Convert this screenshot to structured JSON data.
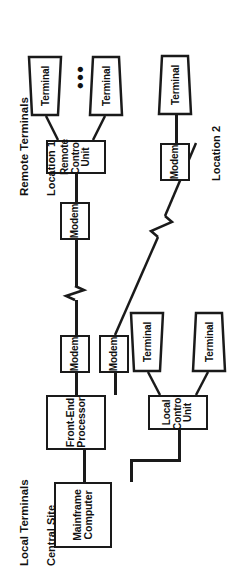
{
  "diagram": {
    "orientation": "rotated-90-ccw",
    "colors": {
      "stroke": "#1a1a1a",
      "background": "#ffffff",
      "text": "#111111"
    },
    "captions": {
      "local_terminals": "Local Terminals",
      "central_site": "Central Site",
      "remote_terminals": "Remote Terminals",
      "location_1": "Location 1",
      "location_2": "Location 2"
    },
    "ellipsis": "•••",
    "nodes": {
      "mainframe": "Mainframe\nComputer",
      "front_end_processor": "Front-End\nProcessor",
      "local_control_unit": "Local\nControl\nUnit",
      "remote_control_unit": "Remote\nControl\nUnit",
      "modem_central_a": "Modem",
      "modem_central_b": "Modem",
      "modem_loc1": "Modem",
      "modem_loc2": "Modem",
      "terminal_local_1": "Terminal",
      "terminal_local_2": "Terminal",
      "terminal_loc1_a": "Terminal",
      "terminal_loc1_b": "Terminal",
      "terminal_loc2": "Terminal"
    }
  }
}
